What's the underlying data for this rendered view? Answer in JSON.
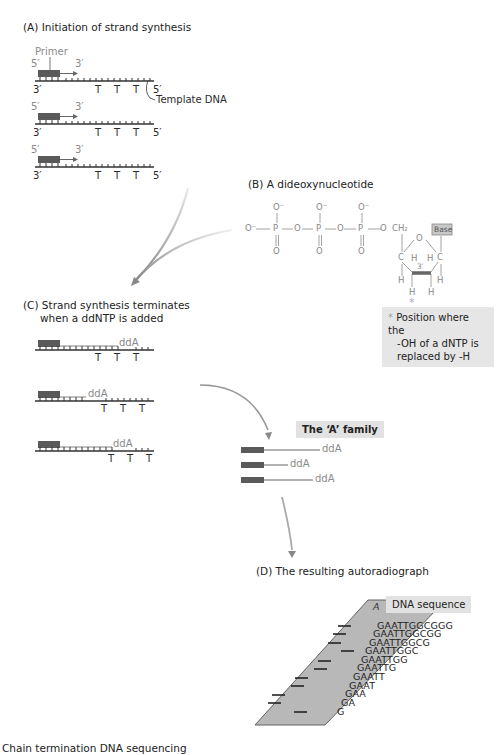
{
  "panelA": {
    "title": "(A) Initiation of strand synthesis",
    "primer_label": "Primer",
    "template_label": "Template DNA",
    "five_prime": "5′",
    "three_prime": "3′",
    "template_bases": [
      "T",
      "T",
      "T"
    ],
    "strand_count": 3
  },
  "panelB": {
    "title": "(B) A dideoxynucleotide",
    "atoms": {
      "o_minus": "O⁻",
      "o": "O",
      "p": "P",
      "ch2": "CH₂",
      "c": "C",
      "h": "H",
      "three": "3′",
      "base": "Base",
      "star": "*"
    },
    "note_lines": [
      "Position where the",
      "-OH of a dNTP is",
      "replaced by -H"
    ],
    "note_star": "*"
  },
  "panelC": {
    "title_line1": "(C) Strand synthesis terminates",
    "title_line2": "when a ddNTP is added",
    "terminator_label": "ddA",
    "template_bases": [
      "T",
      "T",
      "T"
    ]
  },
  "family": {
    "title": "The ‘A’ family",
    "fragments": [
      "ddA",
      "ddA",
      "ddA"
    ]
  },
  "panelD": {
    "title": "(D) The resulting autoradiograph",
    "lanes": [
      "A",
      "T",
      "G",
      "C"
    ],
    "sequence_label": "DNA sequence",
    "sequences": [
      "GAATTGGCGGG",
      "GAATTGGCGG",
      "GAATTGGCG",
      "GAATTGGC",
      "GAATTGG",
      "GAATTG",
      "GAATT",
      "GAAT",
      "GAA",
      "GA",
      "G"
    ]
  },
  "caption": "Chain termination DNA sequencing",
  "colors": {
    "primer": "#5a5a5a",
    "line": "#333333",
    "arrow_grey": "#8c8c8c",
    "gel": "#b8b8b8",
    "label_box": "#e2e2e2"
  }
}
